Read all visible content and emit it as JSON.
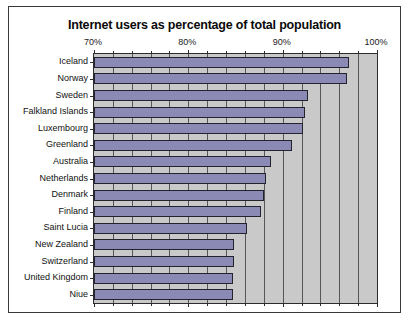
{
  "chart_data": {
    "type": "bar",
    "orientation": "horizontal",
    "title": "Internet users as percentage of total population",
    "xlabel": "",
    "ylabel": "",
    "xlim": [
      70,
      100
    ],
    "grid": true,
    "legend": null,
    "xunit": "%",
    "xtick_labels": [
      "70%",
      "80%",
      "90%",
      "100%"
    ],
    "xticks": [
      70,
      80,
      90,
      100
    ],
    "xticks_minor": [
      72,
      74,
      76,
      78,
      82,
      84,
      86,
      88,
      92,
      94,
      96,
      98
    ],
    "gridline_values": [
      72,
      74,
      76,
      78,
      80,
      82,
      84,
      86,
      88,
      90,
      92,
      94,
      96,
      98
    ],
    "categories": [
      "Iceland",
      "Norway",
      "Sweden",
      "Falkland Islands",
      "Luxembourg",
      "Greenland",
      "Australia",
      "Netherlands",
      "Denmark",
      "Finland",
      "Saint Lucia",
      "New Zealand",
      "Switzerland",
      "United Kingdom",
      "Niue"
    ],
    "values": [
      97.0,
      96.8,
      92.7,
      92.4,
      92.2,
      91.0,
      88.8,
      88.2,
      88.0,
      87.7,
      86.2,
      84.8,
      84.8,
      84.7,
      84.7
    ]
  },
  "colors": {
    "bar_fill": "#8a8ab4",
    "bar_border": "#23232e",
    "plot_background": "#c9c9c9",
    "gridline": "#55555a",
    "frame_border": "#3a3a3a",
    "page_background": "#ffffff",
    "text": "#111111"
  }
}
